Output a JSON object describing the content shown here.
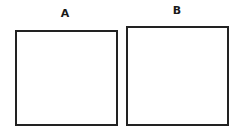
{
  "figures": [
    {
      "label": "A",
      "shape": "square"
    },
    {
      "label": "B",
      "shape": "square"
    }
  ],
  "colors": {
    "stroke": "#222222",
    "background": "#ffffff"
  }
}
